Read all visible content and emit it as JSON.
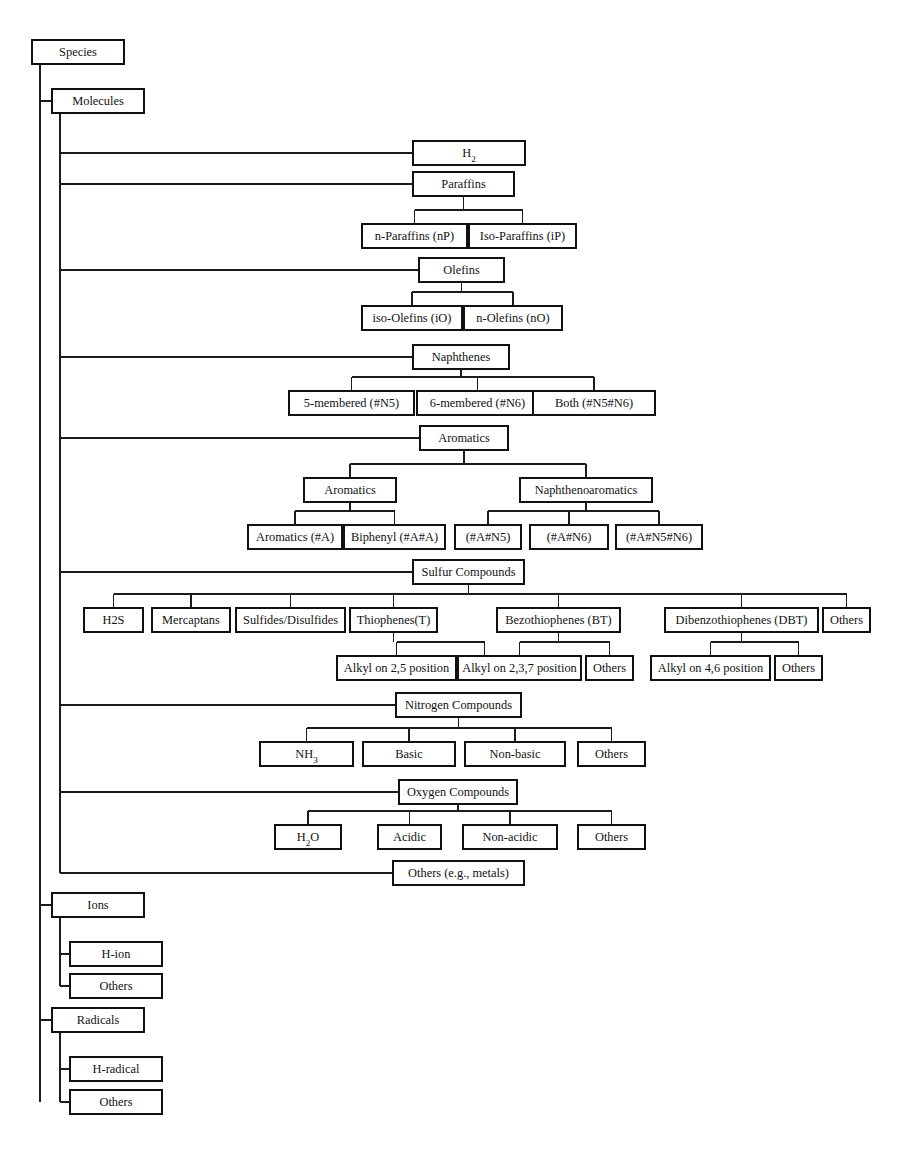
{
  "diagram": {
    "type": "tree",
    "orientation": "left-to-right-then-down",
    "colors": {
      "background": "#ffffff",
      "box_stroke": "#111111",
      "box_fill": "#ffffff",
      "connector": "#1c1c1c",
      "text": "#111111"
    }
  },
  "nodes": [
    {
      "id": "species",
      "label": "Species",
      "x": 32,
      "y": 40,
      "w": 92,
      "h": 24
    },
    {
      "id": "molecules",
      "label": "Molecules",
      "x": 52,
      "y": 89,
      "w": 92,
      "h": 24
    },
    {
      "id": "h2",
      "label": "H",
      "sub": "2",
      "x": 413,
      "y": 141,
      "w": 112,
      "h": 24
    },
    {
      "id": "paraffins",
      "label": "Paraffins",
      "x": 413,
      "y": 172,
      "w": 101,
      "h": 24
    },
    {
      "id": "n_paraffins",
      "label": "n-Paraffins (nP)",
      "x": 362,
      "y": 224,
      "w": 105,
      "h": 24
    },
    {
      "id": "iso_paraffins",
      "label": "Iso-Paraffins (iP)",
      "x": 469,
      "y": 224,
      "w": 107,
      "h": 24
    },
    {
      "id": "olefins",
      "label": "Olefins",
      "x": 419,
      "y": 258,
      "w": 85,
      "h": 24
    },
    {
      "id": "iso_olefins",
      "label": "iso-Olefins (iO)",
      "x": 362,
      "y": 306,
      "w": 100,
      "h": 24
    },
    {
      "id": "n_olefins",
      "label": "n-Olefins (nO)",
      "x": 464,
      "y": 306,
      "w": 98,
      "h": 24
    },
    {
      "id": "naphthenes",
      "label": "Naphthenes",
      "x": 413,
      "y": 345,
      "w": 96,
      "h": 24
    },
    {
      "id": "n5",
      "label": "5-membered (#N5)",
      "x": 289,
      "y": 391,
      "w": 125,
      "h": 24
    },
    {
      "id": "n6",
      "label": "6-membered (#N6)",
      "x": 417,
      "y": 391,
      "w": 121,
      "h": 24
    },
    {
      "id": "n5n6",
      "label": "Both (#N5#N6)",
      "x": 533,
      "y": 391,
      "w": 122,
      "h": 24
    },
    {
      "id": "aromatics_top",
      "label": "Aromatics",
      "x": 420,
      "y": 426,
      "w": 88,
      "h": 24
    },
    {
      "id": "aromatics_mid",
      "label": "Aromatics",
      "x": 304,
      "y": 478,
      "w": 92,
      "h": 24
    },
    {
      "id": "naphthenoarom",
      "label": "Naphthenoaromatics",
      "x": 520,
      "y": 478,
      "w": 132,
      "h": 24
    },
    {
      "id": "arom_a",
      "label": "Aromatics (#A)",
      "x": 248,
      "y": 525,
      "w": 94,
      "h": 24
    },
    {
      "id": "biphenyl",
      "label": "Biphenyl (#A#A)",
      "x": 344,
      "y": 525,
      "w": 101,
      "h": 24
    },
    {
      "id": "a_n5",
      "label": "(#A#N5)",
      "x": 455,
      "y": 525,
      "w": 66,
      "h": 24
    },
    {
      "id": "a_n6",
      "label": "(#A#N6)",
      "x": 530,
      "y": 525,
      "w": 78,
      "h": 24
    },
    {
      "id": "a_n5_n6",
      "label": "(#A#N5#N6)",
      "x": 616,
      "y": 525,
      "w": 86,
      "h": 24
    },
    {
      "id": "sulfur",
      "label": "Sulfur Compounds",
      "x": 413,
      "y": 560,
      "w": 111,
      "h": 24
    },
    {
      "id": "h2s",
      "label": "H2S",
      "x": 84,
      "y": 608,
      "w": 59,
      "h": 24
    },
    {
      "id": "mercaptans",
      "label": "Mercaptans",
      "x": 152,
      "y": 608,
      "w": 78,
      "h": 24
    },
    {
      "id": "sulfides",
      "label": "Sulfides/Disulfides",
      "x": 236,
      "y": 608,
      "w": 109,
      "h": 24
    },
    {
      "id": "thiophenes",
      "label": "Thiophenes(T)",
      "x": 350,
      "y": 608,
      "w": 87,
      "h": 24
    },
    {
      "id": "bt",
      "label": "Bezothiophenes (BT)",
      "x": 497,
      "y": 608,
      "w": 123,
      "h": 24
    },
    {
      "id": "dbt",
      "label": "Dibenzothiophenes (DBT)",
      "x": 665,
      "y": 608,
      "w": 153,
      "h": 24
    },
    {
      "id": "sulfur_others",
      "label": "Others",
      "x": 823,
      "y": 608,
      "w": 47,
      "h": 24
    },
    {
      "id": "alkyl25",
      "label": "Alkyl on 2,5 position",
      "x": 337,
      "y": 656,
      "w": 119,
      "h": 24
    },
    {
      "id": "t_others",
      "label": "Others",
      "x": 461,
      "y": 656,
      "w": 47,
      "h": 24
    },
    {
      "id": "alkyl237",
      "label": "Alkyl on 2,3,7 position",
      "x": 458,
      "y": 656,
      "w": 123,
      "h": 24
    },
    {
      "id": "bt_others",
      "label": "Others",
      "x": 586,
      "y": 656,
      "w": 47,
      "h": 24
    },
    {
      "id": "alkyl46",
      "label": "Alkyl on 4,6 position",
      "x": 651,
      "y": 656,
      "w": 119,
      "h": 24
    },
    {
      "id": "dbt_others",
      "label": "Others",
      "x": 775,
      "y": 656,
      "w": 47,
      "h": 24
    },
    {
      "id": "nitrogen",
      "label": "Nitrogen Compounds",
      "x": 396,
      "y": 693,
      "w": 125,
      "h": 24
    },
    {
      "id": "nh3",
      "label": "NH",
      "sub": "3",
      "x": 260,
      "y": 742,
      "w": 93,
      "h": 24
    },
    {
      "id": "basic",
      "label": "Basic",
      "x": 363,
      "y": 742,
      "w": 92,
      "h": 24
    },
    {
      "id": "nonbasic",
      "label": "Non-basic",
      "x": 465,
      "y": 742,
      "w": 100,
      "h": 24
    },
    {
      "id": "n_others",
      "label": "Others",
      "x": 578,
      "y": 742,
      "w": 67,
      "h": 24
    },
    {
      "id": "oxygen",
      "label": "Oxygen Compounds",
      "x": 399,
      "y": 780,
      "w": 118,
      "h": 24
    },
    {
      "id": "h2o",
      "label": "H",
      "sub": "2",
      "post": "O",
      "x": 275,
      "y": 825,
      "w": 66,
      "h": 24
    },
    {
      "id": "acidic",
      "label": "Acidic",
      "x": 378,
      "y": 825,
      "w": 63,
      "h": 24
    },
    {
      "id": "nonacidic",
      "label": "Non-acidic",
      "x": 463,
      "y": 825,
      "w": 94,
      "h": 24
    },
    {
      "id": "o_others",
      "label": "Others",
      "x": 578,
      "y": 825,
      "w": 67,
      "h": 24
    },
    {
      "id": "metals",
      "label": "Others (e.g., metals)",
      "x": 393,
      "y": 861,
      "w": 131,
      "h": 24
    },
    {
      "id": "ions",
      "label": "Ions",
      "x": 52,
      "y": 893,
      "w": 92,
      "h": 24
    },
    {
      "id": "h_ion",
      "label": "H-ion",
      "x": 70,
      "y": 942,
      "w": 92,
      "h": 24
    },
    {
      "id": "ion_others",
      "label": "Others",
      "x": 70,
      "y": 974,
      "w": 92,
      "h": 24
    },
    {
      "id": "radicals",
      "label": "Radicals",
      "x": 52,
      "y": 1008,
      "w": 92,
      "h": 24
    },
    {
      "id": "h_radical",
      "label": "H-radical",
      "x": 70,
      "y": 1057,
      "w": 92,
      "h": 24
    },
    {
      "id": "rad_others",
      "label": "Others",
      "x": 70,
      "y": 1090,
      "w": 92,
      "h": 24
    }
  ],
  "edges": {
    "species_trunk": {
      "x": 40,
      "y1": 64,
      "y2": 1102
    },
    "species_children": [
      "molecules",
      "ions",
      "radicals"
    ],
    "molecules_trunk": {
      "x": 60,
      "y1": 113,
      "y2": 873
    },
    "molecules_children": [
      "h2",
      "paraffins",
      "olefins",
      "naphthenes",
      "aromatics_top",
      "sulfur",
      "nitrogen",
      "oxygen",
      "metals"
    ],
    "ions_trunk": {
      "x": 60,
      "y1": 917,
      "y2": 986
    },
    "ions_children": [
      "h_ion",
      "ion_others"
    ],
    "radicals_trunk": {
      "x": 60,
      "y1": 1032,
      "y2": 1102
    },
    "radicals_children": [
      "h_radical",
      "rad_others"
    ],
    "groups": [
      {
        "parent": "paraffins",
        "children": [
          "n_paraffins",
          "iso_paraffins"
        ]
      },
      {
        "parent": "olefins",
        "children": [
          "iso_olefins",
          "n_olefins"
        ]
      },
      {
        "parent": "naphthenes",
        "children": [
          "n5",
          "n6",
          "n5n6"
        ]
      },
      {
        "parent": "aromatics_top",
        "children": [
          "aromatics_mid",
          "naphthenoarom"
        ]
      },
      {
        "parent": "aromatics_mid",
        "children": [
          "arom_a",
          "biphenyl"
        ]
      },
      {
        "parent": "naphthenoarom",
        "children": [
          "a_n5",
          "a_n6",
          "a_n5_n6"
        ]
      },
      {
        "parent": "sulfur",
        "children": [
          "h2s",
          "mercaptans",
          "sulfides",
          "thiophenes",
          "bt",
          "dbt",
          "sulfur_others"
        ]
      },
      {
        "parent": "thiophenes",
        "children": [
          "alkyl25",
          "t_others"
        ]
      },
      {
        "parent": "bt",
        "children": [
          "alkyl237",
          "bt_others"
        ]
      },
      {
        "parent": "dbt",
        "children": [
          "alkyl46",
          "dbt_others"
        ]
      },
      {
        "parent": "nitrogen",
        "children": [
          "nh3",
          "basic",
          "nonbasic",
          "n_others"
        ]
      },
      {
        "parent": "oxygen",
        "children": [
          "h2o",
          "acidic",
          "nonacidic",
          "o_others"
        ]
      }
    ]
  }
}
